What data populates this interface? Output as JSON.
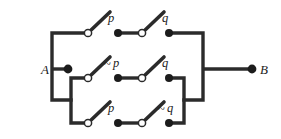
{
  "figure": {
    "type": "switching-circuit",
    "background_color": "#ffffff",
    "line_color": "#2b2b2b",
    "node_color": "#1c1c1c"
  },
  "terminals": {
    "left": {
      "label": "A",
      "x": 41,
      "y": 69,
      "node_x": 68,
      "node_y": 69
    },
    "right": {
      "label": "B",
      "x": 266,
      "y": 69,
      "node_x": 252,
      "node_y": 69
    }
  },
  "branches": [
    {
      "name": "top",
      "y": 33,
      "switches": [
        {
          "id": "top-switch-1",
          "label": "p",
          "negated": false,
          "pivot_x": 88,
          "label_x": 108,
          "label_y": 22
        },
        {
          "id": "top-switch-2",
          "label": "q",
          "negated": false,
          "pivot_x": 142,
          "label_x": 162,
          "label_y": 22
        }
      ]
    },
    {
      "name": "middle",
      "y": 78,
      "switches": [
        {
          "id": "middle-switch-1",
          "label": "p",
          "negated": true,
          "pivot_x": 88,
          "label_x": 104,
          "label_y": 67
        },
        {
          "id": "middle-switch-2",
          "label": "q",
          "negated": false,
          "pivot_x": 142,
          "label_x": 162,
          "label_y": 67
        }
      ]
    },
    {
      "name": "bottom",
      "y": 123,
      "switches": [
        {
          "id": "bottom-switch-1",
          "label": "p",
          "negated": false,
          "pivot_x": 88,
          "label_x": 108,
          "label_y": 112
        },
        {
          "id": "bottom-switch-2",
          "label": "q",
          "negated": true,
          "pivot_x": 142,
          "label_x": 158,
          "label_y": 112
        }
      ]
    }
  ],
  "labels": {
    "terminal_a": "A",
    "terminal_b": "B",
    "top_p": "p",
    "top_q": "q",
    "middle_not_p": "p",
    "middle_not_p_prefix": "~",
    "middle_q": "q",
    "bottom_p": "p",
    "bottom_not_q": "q",
    "bottom_not_q_prefix": "~"
  }
}
